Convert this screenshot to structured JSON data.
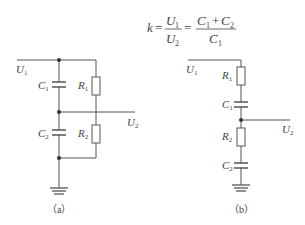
{
  "formula": {
    "lhs": "k",
    "eq1": "=",
    "frac1": {
      "num": "U",
      "num_sub": "1",
      "den": "U",
      "den_sub": "2"
    },
    "eq2": "=",
    "frac2": {
      "num_a": "C",
      "num_a_sub": "1",
      "plus": "+",
      "num_b": "C",
      "num_b_sub": "2",
      "den": "C",
      "den_sub": "1"
    }
  },
  "circuit_a": {
    "caption": "（a）",
    "labels": {
      "u1": {
        "main": "U",
        "sub": "1"
      },
      "u2": {
        "main": "U",
        "sub": "2"
      },
      "c1": {
        "main": "C",
        "sub": "1"
      },
      "c2": {
        "main": "C",
        "sub": "2"
      },
      "r1": {
        "main": "R",
        "sub": "1"
      },
      "r2": {
        "main": "R",
        "sub": "2"
      }
    }
  },
  "circuit_b": {
    "caption": "（b）",
    "labels": {
      "u1": {
        "main": "U",
        "sub": "1"
      },
      "u2": {
        "main": "U",
        "sub": "2"
      },
      "r1": {
        "main": "R",
        "sub": "1"
      },
      "c1": {
        "main": "C",
        "sub": "1"
      },
      "r2": {
        "main": "R",
        "sub": "2"
      },
      "c2": {
        "main": "C",
        "sub": "2"
      }
    }
  },
  "colors": {
    "wire": "#555555",
    "text": "#444444",
    "background": "#ffffff"
  }
}
